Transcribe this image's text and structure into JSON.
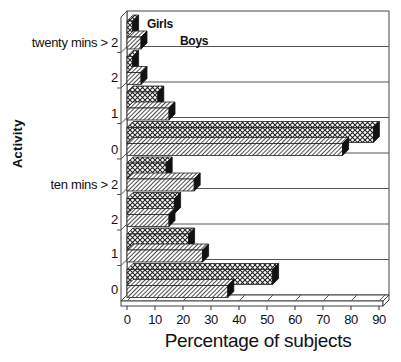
{
  "chart_data": {
    "type": "bar",
    "orientation": "horizontal",
    "style": "3d",
    "title": "",
    "xlabel": "Percentage of subjects",
    "ylabel": "Activity",
    "xlim": [
      0,
      90
    ],
    "xticks": [
      0,
      10,
      20,
      30,
      40,
      50,
      60,
      70,
      80,
      90
    ],
    "grid": false,
    "legend": [
      "Girls",
      "Boys"
    ],
    "legend_position": "inside-top-left",
    "categories": [
      "twenty mins > 2",
      "2",
      "1",
      "0",
      "ten mins > 2",
      "2",
      "1",
      "0"
    ],
    "series": [
      {
        "name": "Girls",
        "pattern": "crosshatch",
        "values": [
          2,
          2,
          11,
          88,
          14,
          17,
          22,
          52
        ]
      },
      {
        "name": "Boys",
        "pattern": "diagonal-hatch",
        "values": [
          5,
          5,
          15,
          77,
          24,
          15,
          27,
          36
        ]
      }
    ]
  },
  "labels": {
    "ylabel": "Activity",
    "xlabel": "Percentage of subjects",
    "legend_girls": "Girls",
    "legend_boys": "Boys",
    "categories": [
      "twenty mins > 2",
      "2",
      "1",
      "0",
      "ten mins > 2",
      "2",
      "1",
      "0"
    ],
    "ticks": [
      "0",
      "10",
      "20",
      "30",
      "40",
      "50",
      "60",
      "70",
      "80",
      "90"
    ]
  }
}
